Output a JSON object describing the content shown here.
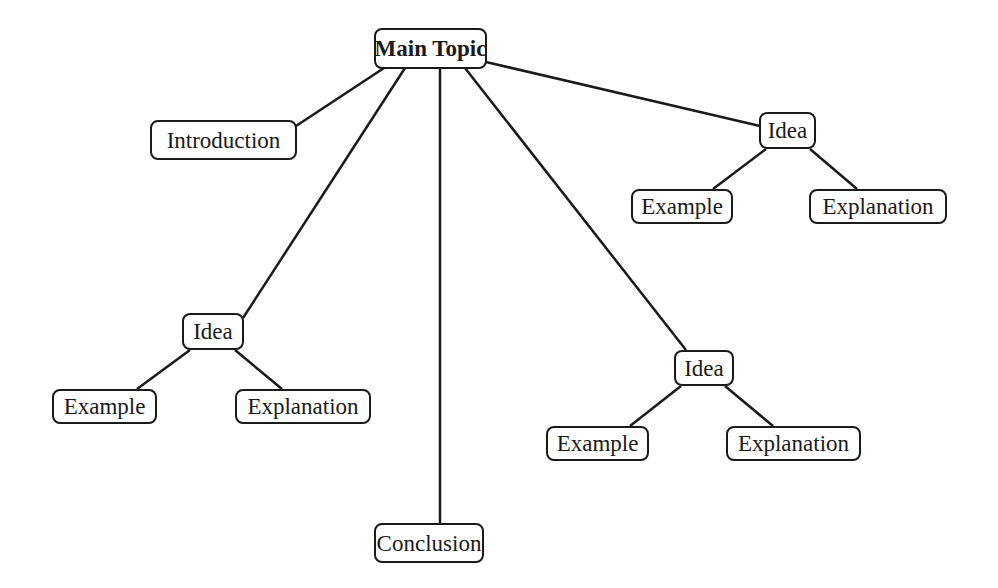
{
  "diagram": {
    "type": "mind-map",
    "nodes": [
      {
        "id": "main",
        "label": "Main Topic",
        "bold": true,
        "x": 374,
        "y": 28,
        "w": 113,
        "h": 41
      },
      {
        "id": "intro",
        "label": "Introduction",
        "x": 150,
        "y": 120,
        "w": 147,
        "h": 40
      },
      {
        "id": "idea_tr",
        "label": "Idea",
        "x": 759,
        "y": 112,
        "w": 57,
        "h": 37
      },
      {
        "id": "ex_tr",
        "label": "Example",
        "x": 631,
        "y": 189,
        "w": 102,
        "h": 35
      },
      {
        "id": "expl_tr",
        "label": "Explanation",
        "x": 809,
        "y": 189,
        "w": 138,
        "h": 35
      },
      {
        "id": "idea_l",
        "label": "Idea",
        "x": 182,
        "y": 313,
        "w": 62,
        "h": 37
      },
      {
        "id": "ex_l",
        "label": "Example",
        "x": 52,
        "y": 389,
        "w": 105,
        "h": 35
      },
      {
        "id": "expl_l",
        "label": "Explanation",
        "x": 235,
        "y": 389,
        "w": 136,
        "h": 35
      },
      {
        "id": "idea_r",
        "label": "Idea",
        "x": 674,
        "y": 350,
        "w": 60,
        "h": 36
      },
      {
        "id": "ex_r",
        "label": "Example",
        "x": 546,
        "y": 426,
        "w": 103,
        "h": 35
      },
      {
        "id": "expl_r",
        "label": "Explanation",
        "x": 726,
        "y": 426,
        "w": 135,
        "h": 35
      },
      {
        "id": "concl",
        "label": "Conclusion",
        "x": 374,
        "y": 523,
        "w": 110,
        "h": 40
      }
    ],
    "edges": [
      {
        "from": "main",
        "to": "intro",
        "x1": 384,
        "y1": 68,
        "x2": 296,
        "y2": 126
      },
      {
        "from": "main",
        "to": "idea_l",
        "x1": 405,
        "y1": 68,
        "x2": 243,
        "y2": 318
      },
      {
        "from": "main",
        "to": "concl",
        "x1": 440,
        "y1": 68,
        "x2": 440,
        "y2": 523
      },
      {
        "from": "main",
        "to": "idea_r",
        "x1": 465,
        "y1": 68,
        "x2": 686,
        "y2": 350
      },
      {
        "from": "main",
        "to": "idea_tr",
        "x1": 486,
        "y1": 62,
        "x2": 760,
        "y2": 126
      },
      {
        "from": "idea_tr",
        "to": "ex_tr",
        "x1": 766,
        "y1": 149,
        "x2": 713,
        "y2": 189
      },
      {
        "from": "idea_tr",
        "to": "expl_tr",
        "x1": 810,
        "y1": 149,
        "x2": 857,
        "y2": 189
      },
      {
        "from": "idea_l",
        "to": "ex_l",
        "x1": 190,
        "y1": 350,
        "x2": 137,
        "y2": 389
      },
      {
        "from": "idea_l",
        "to": "expl_l",
        "x1": 235,
        "y1": 350,
        "x2": 282,
        "y2": 389
      },
      {
        "from": "idea_r",
        "to": "ex_r",
        "x1": 681,
        "y1": 386,
        "x2": 630,
        "y2": 426
      },
      {
        "from": "idea_r",
        "to": "expl_r",
        "x1": 725,
        "y1": 386,
        "x2": 773,
        "y2": 426
      }
    ],
    "colors": {
      "stroke": "#1a1a1a",
      "background": "#ffffff"
    }
  }
}
